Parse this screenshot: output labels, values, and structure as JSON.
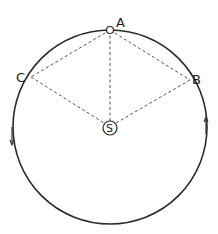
{
  "diagram": {
    "type": "orbit-diagram",
    "points": {
      "A": {
        "label": "A"
      },
      "B": {
        "label": "B"
      },
      "C": {
        "label": "C"
      },
      "S": {
        "label": "S"
      }
    },
    "arrows": {
      "left": "downward",
      "right": "upward"
    },
    "colors": {
      "line": "#2a2a2a",
      "dashed": "#555555",
      "background": "#ffffff"
    }
  }
}
